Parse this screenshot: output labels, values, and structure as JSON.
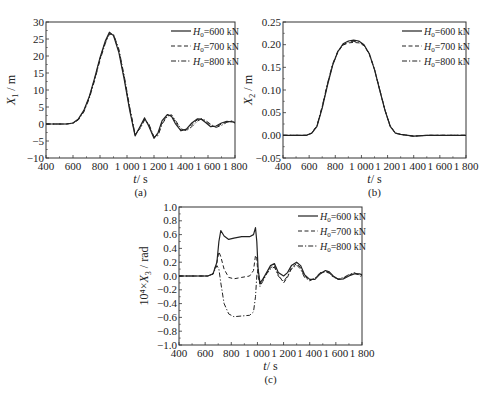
{
  "chart_data": [
    {
      "id": "a",
      "type": "line",
      "panel_label": "(a)",
      "xlabel": "t / s",
      "ylabel": "X1 / m",
      "ylabel_main": "X",
      "ylabel_sub": "1",
      "ylabel_unit": "/ m",
      "xlim": [
        400,
        1800
      ],
      "ylim": [
        -10,
        30
      ],
      "xticks": [
        400,
        600,
        800,
        1000,
        1200,
        1400,
        1600,
        1800
      ],
      "xtick_labels": [
        "400",
        "600",
        "800",
        "1 000",
        "1 200",
        "1 400",
        "1 600",
        "1 800"
      ],
      "yticks": [
        -10,
        -5,
        0,
        5,
        10,
        15,
        20,
        25,
        30
      ],
      "ytick_labels": [
        "−10",
        "−5",
        "0",
        "5",
        "10",
        "15",
        "20",
        "25",
        "30"
      ],
      "grid": false,
      "legend_position": "upper right",
      "series": [
        {
          "name": "H0=600 kN",
          "style": "solid",
          "x": [
            400,
            550,
            600,
            640,
            680,
            720,
            760,
            800,
            840,
            870,
            900,
            940,
            980,
            1020,
            1060,
            1100,
            1130,
            1160,
            1200,
            1230,
            1260,
            1300,
            1330,
            1360,
            1400,
            1440,
            1480,
            1520,
            1550,
            1580,
            1620,
            1660,
            1700,
            1740,
            1780,
            1800
          ],
          "y": [
            0,
            0,
            0.3,
            1.5,
            4,
            8,
            13.5,
            19.5,
            24.5,
            27,
            26,
            21,
            13,
            4,
            -3.5,
            -0.5,
            1.8,
            -0.5,
            -4.2,
            -2.5,
            1,
            2.8,
            2.2,
            0,
            -2,
            -1.5,
            0.3,
            1.5,
            1.4,
            0.5,
            -0.8,
            -0.6,
            0.3,
            0.8,
            0.6,
            0.5
          ]
        },
        {
          "name": "H0=700 kN",
          "style": "dashed",
          "x": [
            400,
            550,
            600,
            640,
            680,
            720,
            760,
            800,
            840,
            870,
            900,
            940,
            980,
            1020,
            1060,
            1100,
            1130,
            1160,
            1200,
            1230,
            1260,
            1300,
            1330,
            1360,
            1400,
            1440,
            1480,
            1520,
            1550,
            1580,
            1620,
            1660,
            1700,
            1740,
            1780,
            1800
          ],
          "y": [
            0,
            0,
            0.3,
            1.4,
            3.8,
            7.8,
            13.2,
            19.2,
            24.2,
            26.6,
            26.2,
            21.5,
            13.5,
            4.5,
            -3.3,
            -0.8,
            1.5,
            -0.2,
            -4,
            -3,
            0.5,
            2.6,
            2.5,
            0.5,
            -1.8,
            -1.8,
            -0.2,
            1.2,
            1.5,
            0.8,
            -0.5,
            -0.9,
            0,
            0.7,
            0.8,
            0.4
          ]
        },
        {
          "name": "H0=800 kN",
          "style": "dashdot",
          "x": [
            400,
            550,
            600,
            640,
            680,
            720,
            760,
            800,
            840,
            870,
            900,
            940,
            980,
            1020,
            1060,
            1100,
            1130,
            1160,
            1200,
            1230,
            1260,
            1300,
            1330,
            1360,
            1400,
            1440,
            1480,
            1520,
            1550,
            1580,
            1620,
            1660,
            1700,
            1740,
            1780,
            1800
          ],
          "y": [
            0,
            0,
            0.2,
            1.2,
            3.5,
            7.4,
            12.8,
            18.8,
            23.8,
            26.4,
            26.4,
            22,
            14,
            5,
            -3,
            -1.2,
            1.2,
            0.2,
            -3.8,
            -3.4,
            0,
            2.3,
            2.7,
            1,
            -1.4,
            -2,
            -0.8,
            0.8,
            1.5,
            1.1,
            -0.1,
            -1,
            -0.4,
            0.5,
            0.9,
            0.2
          ]
        }
      ]
    },
    {
      "id": "b",
      "type": "line",
      "panel_label": "(b)",
      "xlabel": "t / s",
      "ylabel": "X2 / m",
      "ylabel_main": "X",
      "ylabel_sub": "2",
      "ylabel_unit": "/ m",
      "xlim": [
        400,
        1800
      ],
      "ylim": [
        -0.05,
        0.25
      ],
      "xticks": [
        400,
        600,
        800,
        1000,
        1200,
        1400,
        1600,
        1800
      ],
      "xtick_labels": [
        "400",
        "600",
        "800",
        "1 000",
        "1 200",
        "1 400",
        "1 600",
        "1 800"
      ],
      "yticks": [
        -0.05,
        0.0,
        0.05,
        0.1,
        0.15,
        0.2,
        0.25
      ],
      "ytick_labels": [
        "−0.05",
        "0.00",
        "0.05",
        "0.10",
        "0.15",
        "0.20",
        "0.25"
      ],
      "grid": false,
      "legend_position": "upper right",
      "series": [
        {
          "name": "H0=600 kN",
          "style": "solid",
          "x": [
            400,
            580,
            620,
            660,
            700,
            740,
            780,
            820,
            860,
            900,
            940,
            980,
            1020,
            1060,
            1100,
            1140,
            1180,
            1220,
            1260,
            1300,
            1400,
            1500,
            1600,
            1800
          ],
          "y": [
            0,
            0,
            0.005,
            0.02,
            0.06,
            0.11,
            0.155,
            0.185,
            0.202,
            0.208,
            0.21,
            0.208,
            0.2,
            0.18,
            0.145,
            0.1,
            0.055,
            0.02,
            0.005,
            0.002,
            -0.002,
            0,
            0,
            0
          ]
        },
        {
          "name": "H0=700 kN",
          "style": "dashed",
          "x": [
            400,
            580,
            620,
            660,
            700,
            740,
            780,
            820,
            860,
            900,
            940,
            980,
            1020,
            1060,
            1100,
            1140,
            1180,
            1220,
            1260,
            1300,
            1400,
            1500,
            1600,
            1800
          ],
          "y": [
            0,
            0,
            0.005,
            0.021,
            0.062,
            0.112,
            0.156,
            0.184,
            0.199,
            0.204,
            0.205,
            0.204,
            0.198,
            0.179,
            0.145,
            0.1,
            0.055,
            0.02,
            0.005,
            0.002,
            -0.002,
            0,
            0,
            0
          ]
        },
        {
          "name": "H0=800 kN",
          "style": "dashdot",
          "x": [
            400,
            580,
            620,
            660,
            700,
            740,
            780,
            820,
            860,
            900,
            940,
            980,
            1020,
            1060,
            1100,
            1140,
            1180,
            1220,
            1260,
            1300,
            1400,
            1500,
            1600,
            1800
          ],
          "y": [
            0,
            0,
            0.005,
            0.022,
            0.064,
            0.114,
            0.158,
            0.186,
            0.2,
            0.206,
            0.207,
            0.206,
            0.199,
            0.18,
            0.146,
            0.101,
            0.056,
            0.021,
            0.005,
            0.002,
            -0.002,
            0,
            0,
            0
          ]
        }
      ]
    },
    {
      "id": "c",
      "type": "line",
      "panel_label": "(c)",
      "xlabel": "t / s",
      "ylabel": "10^4 × X3 / rad",
      "ylabel_main": "10⁴×X",
      "ylabel_sub": "3",
      "ylabel_unit": "/ rad",
      "xlim": [
        400,
        1800
      ],
      "ylim": [
        -1.0,
        1.0
      ],
      "xticks": [
        400,
        600,
        800,
        1000,
        1200,
        1400,
        1600,
        1800
      ],
      "xtick_labels": [
        "400",
        "600",
        "800",
        "1 000",
        "1 200",
        "1 400",
        "1 600",
        "1 800"
      ],
      "yticks": [
        -1.0,
        -0.8,
        -0.6,
        -0.4,
        -0.2,
        0.0,
        0.2,
        0.4,
        0.6,
        0.8,
        1.0
      ],
      "ytick_labels": [
        "−1.0",
        "−0.8",
        "−0.6",
        "−0.4",
        "−0.2",
        "0.0",
        "0.2",
        "0.4",
        "0.6",
        "0.8",
        "1.0"
      ],
      "grid": false,
      "legend_position": "upper right",
      "series": [
        {
          "name": "H0=600 kN",
          "style": "solid",
          "x": [
            400,
            620,
            660,
            690,
            705,
            720,
            745,
            780,
            820,
            880,
            940,
            970,
            985,
            995,
            1005,
            1020,
            1040,
            1070,
            1100,
            1130,
            1160,
            1200,
            1230,
            1260,
            1300,
            1330,
            1360,
            1400,
            1440,
            1480,
            1520,
            1550,
            1580,
            1620,
            1660,
            1700,
            1740,
            1780,
            1800
          ],
          "y": [
            0,
            0,
            0.03,
            0.2,
            0.5,
            0.66,
            0.58,
            0.53,
            0.55,
            0.57,
            0.57,
            0.6,
            0.7,
            0.5,
            0.1,
            -0.1,
            -0.05,
            0.05,
            0.15,
            0.18,
            0.05,
            0.0,
            0.05,
            0.15,
            0.2,
            0.15,
            0.02,
            -0.05,
            -0.05,
            0.03,
            0.08,
            0.06,
            0.0,
            -0.05,
            -0.04,
            0.0,
            0.03,
            0.03,
            0.02
          ]
        },
        {
          "name": "H0=700 kN",
          "style": "dashed",
          "x": [
            400,
            620,
            660,
            690,
            705,
            720,
            745,
            780,
            820,
            880,
            940,
            970,
            985,
            995,
            1005,
            1020,
            1040,
            1070,
            1100,
            1130,
            1160,
            1200,
            1230,
            1260,
            1300,
            1330,
            1360,
            1400,
            1440,
            1480,
            1520,
            1550,
            1580,
            1620,
            1660,
            1700,
            1740,
            1780,
            1800
          ],
          "y": [
            0,
            0,
            0.03,
            0.2,
            0.35,
            0.28,
            0.1,
            -0.02,
            -0.04,
            -0.02,
            0.0,
            0.08,
            0.3,
            0.25,
            0.0,
            -0.12,
            -0.06,
            0.04,
            0.12,
            0.15,
            0.02,
            -0.1,
            -0.02,
            0.12,
            0.18,
            0.12,
            0.0,
            -0.06,
            -0.04,
            0.04,
            0.07,
            0.05,
            -0.01,
            -0.05,
            -0.03,
            0.01,
            0.04,
            0.02,
            0.0
          ]
        },
        {
          "name": "H0=800 kN",
          "style": "dashdot",
          "x": [
            400,
            620,
            660,
            690,
            705,
            720,
            745,
            780,
            820,
            880,
            940,
            970,
            985,
            995,
            1005,
            1020,
            1040,
            1070,
            1100,
            1130,
            1160,
            1200,
            1230,
            1260,
            1300,
            1330,
            1360,
            1400,
            1440,
            1480,
            1520,
            1550,
            1580,
            1620,
            1660,
            1700,
            1740,
            1780,
            1800
          ],
          "y": [
            0,
            0,
            0.03,
            0.15,
            0.1,
            -0.1,
            -0.4,
            -0.55,
            -0.59,
            -0.58,
            -0.57,
            -0.52,
            -0.3,
            0.0,
            0.1,
            -0.15,
            -0.08,
            0.03,
            0.1,
            0.13,
            0.0,
            -0.08,
            0.0,
            0.1,
            0.16,
            0.1,
            -0.02,
            -0.07,
            -0.03,
            0.05,
            0.06,
            0.04,
            -0.02,
            -0.04,
            -0.02,
            0.02,
            0.05,
            0.01,
            -0.02
          ]
        }
      ]
    }
  ],
  "legend_labels": {
    "s1_prefix": "H",
    "s1_sub": "0",
    "s1_suffix": "=600 kN",
    "s2_prefix": "H",
    "s2_sub": "0",
    "s2_suffix": "=700 kN",
    "s3_prefix": "H",
    "s3_sub": "0",
    "s3_suffix": "=800 kN"
  },
  "axis_text": {
    "t": "t",
    "s_unit": "/ s"
  }
}
